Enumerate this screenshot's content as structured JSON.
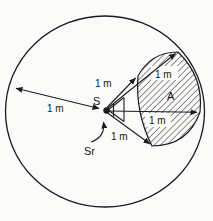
{
  "figure": {
    "labels": {
      "radius_left": "1 m",
      "radius_upper": "1 m",
      "side_top": "1 m",
      "side_right": "1 m",
      "radius_lower": "1 m",
      "source": "S",
      "area": "A",
      "solid_angle": "Sr"
    },
    "colors": {
      "line": "#1c1c1c",
      "background": "#fbfbf9",
      "label_patch": "#fbfbf9"
    }
  }
}
